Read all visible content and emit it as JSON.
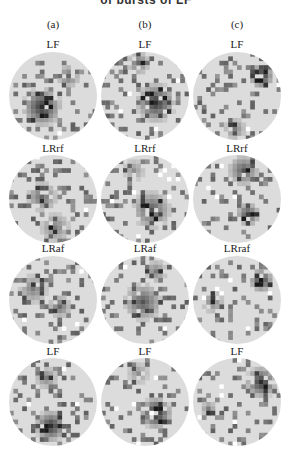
{
  "figure": {
    "top_text_cropped": "of bursts of LF",
    "columns": [
      "(a)",
      "(b)",
      "(c)"
    ],
    "rows": [
      [
        "LF",
        "LF",
        "LF"
      ],
      [
        "LRrf",
        "LRrf",
        "LRrf"
      ],
      [
        "LRaf",
        "LRaf",
        "LRraf"
      ],
      [
        "LF",
        "LF",
        "LF"
      ]
    ],
    "colors": {
      "background": "#ffffff",
      "base": "#dcdcdc",
      "dark": "#1a1a1a"
    },
    "grid_size": 20,
    "hotspots": [
      [
        {
          "cx": 7,
          "cy": 12,
          "r": 5,
          "s": 0.9
        },
        {
          "cx": 13,
          "cy": 5,
          "r": 3,
          "s": 0.6
        }
      ],
      [
        {
          "cx": 12,
          "cy": 11,
          "r": 5,
          "s": 0.9
        },
        {
          "cx": 8,
          "cy": 2,
          "r": 3,
          "s": 0.6
        }
      ],
      [
        {
          "cx": 15,
          "cy": 5,
          "r": 3,
          "s": 1.0
        },
        {
          "cx": 9,
          "cy": 17,
          "r": 3,
          "s": 0.5
        }
      ],
      [
        {
          "cx": 7,
          "cy": 9,
          "r": 4,
          "s": 0.6
        },
        {
          "cx": 10,
          "cy": 16,
          "r": 4,
          "s": 0.5
        }
      ],
      [
        {
          "cx": 11,
          "cy": 12,
          "r": 5,
          "s": 0.7
        },
        {
          "cx": 7,
          "cy": 3,
          "r": 3,
          "s": 0.4
        }
      ],
      [
        {
          "cx": 11,
          "cy": 3,
          "r": 4,
          "s": 0.7
        },
        {
          "cx": 12,
          "cy": 13,
          "r": 3,
          "s": 0.8
        }
      ],
      [
        {
          "cx": 5,
          "cy": 7,
          "r": 4,
          "s": 0.5
        },
        {
          "cx": 11,
          "cy": 11,
          "r": 3,
          "s": 0.6
        }
      ],
      [
        {
          "cx": 9,
          "cy": 10,
          "r": 5,
          "s": 0.7
        },
        {
          "cx": 12,
          "cy": 3,
          "r": 3,
          "s": 0.5
        }
      ],
      [
        {
          "cx": 15,
          "cy": 5,
          "r": 3,
          "s": 0.9
        },
        {
          "cx": 4,
          "cy": 10,
          "r": 3,
          "s": 0.5
        }
      ],
      [
        {
          "cx": 9,
          "cy": 15,
          "r": 4,
          "s": 0.9
        },
        {
          "cx": 8,
          "cy": 4,
          "r": 3,
          "s": 0.5
        }
      ],
      [
        {
          "cx": 12,
          "cy": 12,
          "r": 4,
          "s": 1.0
        },
        {
          "cx": 8,
          "cy": 3,
          "r": 3,
          "s": 0.4
        }
      ],
      [
        {
          "cx": 15,
          "cy": 5,
          "r": 4,
          "s": 0.9
        },
        {
          "cx": 3,
          "cy": 11,
          "r": 2,
          "s": 0.5
        }
      ]
    ]
  }
}
